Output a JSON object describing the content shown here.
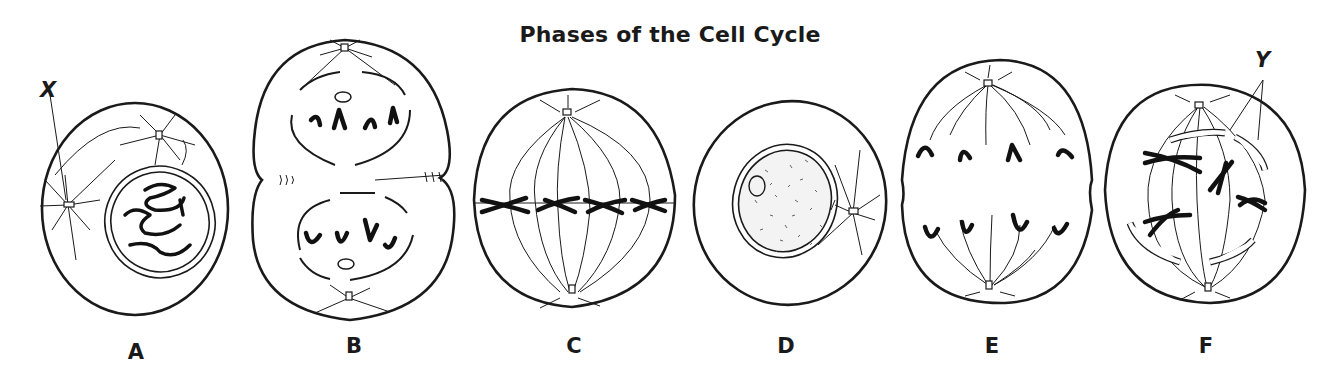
{
  "title": "Phases of the Cell Cycle",
  "cells": [
    {
      "id": "A",
      "label": "A"
    },
    {
      "id": "B",
      "label": "B"
    },
    {
      "id": "C",
      "label": "C"
    },
    {
      "id": "D",
      "label": "D"
    },
    {
      "id": "E",
      "label": "E"
    },
    {
      "id": "F",
      "label": "F"
    }
  ],
  "callouts": {
    "x": "X",
    "y": "Y"
  },
  "colors": {
    "ink": "#1a1a1a",
    "background": "#ffffff",
    "stipple": "#555555"
  }
}
